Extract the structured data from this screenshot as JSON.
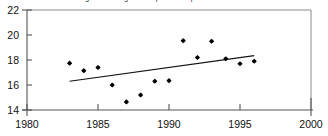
{
  "chart_data": {
    "type": "scatter",
    "title": "Average annual highest temperature reported for 1983 - 1996",
    "xlabel": "",
    "ylabel": "",
    "xlim": [
      1980,
      2000
    ],
    "ylim": [
      14,
      22
    ],
    "xticks": [
      1980,
      1985,
      1990,
      1995,
      2000
    ],
    "yticks": [
      14,
      16,
      18,
      20,
      22
    ],
    "grid": false,
    "legend": "none",
    "marker": "diamond",
    "marker_color": "#000000",
    "series": [
      {
        "name": "Observations",
        "x": [
          1983,
          1984,
          1985,
          1986,
          1987,
          1988,
          1989,
          1990,
          1991,
          1992,
          1993,
          1994,
          1995,
          1996
        ],
        "values": [
          17.75,
          17.15,
          17.4,
          16.0,
          14.65,
          15.2,
          16.3,
          16.35,
          19.55,
          18.2,
          19.5,
          18.1,
          17.7,
          17.9
        ]
      }
    ],
    "trend_line": {
      "name": "Linear fit",
      "x": [
        1983,
        1996
      ],
      "y": [
        16.3,
        18.35
      ],
      "color": "#111111"
    }
  },
  "axes": {
    "x_tick_labels": [
      "1980",
      "1985",
      "1990",
      "1995",
      "2000"
    ],
    "y_tick_labels": [
      "14",
      "16",
      "18",
      "20",
      "22"
    ]
  }
}
